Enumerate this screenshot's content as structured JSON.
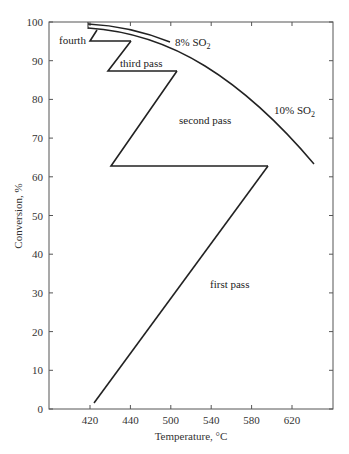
{
  "chart_data": {
    "type": "line",
    "title": "",
    "xlabel": "Temperature, °C",
    "ylabel": "Conversion, %",
    "x_tick_labels": [
      "420",
      "440",
      "500",
      "540",
      "580",
      "620"
    ],
    "y_tick_labels": [
      "0",
      "10",
      "20",
      "30",
      "40",
      "50",
      "60",
      "70",
      "80",
      "90",
      "100"
    ],
    "ylim": [
      0,
      100
    ],
    "grid": false,
    "series": [
      {
        "name": "first pass",
        "x": [
          424,
          595
        ],
        "y": [
          1.5,
          62.8
        ]
      },
      {
        "name": "second pass",
        "x": [
          595,
          430,
          505
        ],
        "y": [
          62.8,
          62.8,
          87.3
        ]
      },
      {
        "name": "third pass",
        "x": [
          505,
          429,
          441
        ],
        "y": [
          87.3,
          87.3,
          95.1
        ]
      },
      {
        "name": "fourth",
        "x": [
          441,
          420,
          424
        ],
        "y": [
          95.1,
          95.1,
          98.0
        ]
      },
      {
        "name": "8% SO2 equilibrium",
        "x": [
          418,
          460,
          500,
          505
        ],
        "y": [
          99.6,
          98.5,
          95.9,
          95.2
        ]
      },
      {
        "name": "10% SO2 equilibrium",
        "x": [
          418,
          460,
          500,
          540,
          580,
          610,
          640
        ],
        "y": [
          98.8,
          97.5,
          94.7,
          89.0,
          83.0,
          74.0,
          63.3
        ]
      }
    ],
    "annotations": [
      "fourth",
      "third pass",
      "second pass",
      "first pass",
      "8% SO2",
      "10% SO2"
    ]
  },
  "labels": {
    "xlabel": "Temperature, °C",
    "ylabel": "Conversion, %",
    "fourth": "fourth",
    "third": "third pass",
    "second": "second pass",
    "first": "first pass",
    "so2_8_main": "8% SO",
    "so2_10_main": "10% SO",
    "sub2": "2"
  },
  "x_ticks": [
    "420",
    "440",
    "500",
    "540",
    "580",
    "620"
  ],
  "y_ticks": [
    "0",
    "10",
    "20",
    "30",
    "40",
    "50",
    "60",
    "70",
    "80",
    "90",
    "100"
  ]
}
